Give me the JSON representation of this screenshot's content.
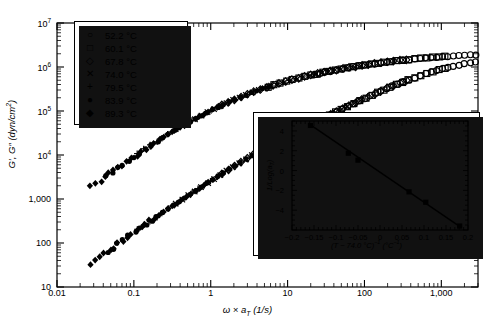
{
  "chart_data": {
    "type": "scatter",
    "title": "",
    "xlabel": "ω × a_T (1/s)",
    "ylabel": "G', G\" (dyn/cm²)",
    "xscale": "log",
    "yscale": "log",
    "xlim": [
      0.01,
      3000
    ],
    "ylim": [
      10,
      10000000
    ],
    "xticks": [
      "0.01",
      "0.1",
      "1",
      "10",
      "100",
      "1,000"
    ],
    "xtick_values": [
      0.01,
      0.1,
      1,
      10,
      100,
      1000
    ],
    "yticks": [
      "10",
      "100",
      "1,000",
      "10⁴",
      "10⁵",
      "10⁶",
      "10⁷"
    ],
    "ytick_values": [
      10,
      100,
      1000,
      10000,
      100000,
      1000000,
      10000000
    ],
    "grid": false,
    "legend_position": "upper-left",
    "legend": [
      {
        "marker": "open-circle",
        "label": "52.2 °C"
      },
      {
        "marker": "open-square",
        "label": "60.1 °C"
      },
      {
        "marker": "open-diamond",
        "label": "67.8 °C"
      },
      {
        "marker": "cross-x",
        "label": "74.0 °C"
      },
      {
        "marker": "plus",
        "label": "79.5 °C"
      },
      {
        "marker": "filled-circle",
        "label": "83.9 °C"
      },
      {
        "marker": "filled-diamond",
        "label": "89.3 °C"
      }
    ],
    "series": [
      {
        "name": "G'",
        "branch": "upper",
        "points": [
          [
            0.028,
            1900
          ],
          [
            0.035,
            2500
          ],
          [
            0.045,
            3400
          ],
          [
            0.058,
            4600
          ],
          [
            0.075,
            6300
          ],
          [
            0.1,
            9000
          ],
          [
            0.13,
            12500
          ],
          [
            0.17,
            17000
          ],
          [
            0.22,
            23000
          ],
          [
            0.3,
            32000
          ],
          [
            0.4,
            43000
          ],
          [
            0.55,
            58000
          ],
          [
            0.75,
            78000
          ],
          [
            1.0,
            103000
          ],
          [
            1.4,
            135000
          ],
          [
            1.9,
            172000
          ],
          [
            2.6,
            215000
          ],
          [
            3.5,
            265000
          ],
          [
            5.0,
            330000
          ],
          [
            7.0,
            400000
          ],
          [
            10,
            480000
          ],
          [
            14,
            560000
          ],
          [
            20,
            650000
          ],
          [
            30,
            760000
          ],
          [
            45,
            870000
          ],
          [
            65,
            980000
          ],
          [
            95,
            1090000
          ],
          [
            140,
            1200000
          ],
          [
            200,
            1300000
          ],
          [
            300,
            1420000
          ],
          [
            450,
            1530000
          ],
          [
            650,
            1620000
          ],
          [
            950,
            1700000
          ],
          [
            1400,
            1780000
          ],
          [
            2000,
            1850000
          ],
          [
            2800,
            1900000
          ]
        ]
      },
      {
        "name": "G\"",
        "branch": "lower",
        "points": [
          [
            0.028,
            33
          ],
          [
            0.035,
            45
          ],
          [
            0.045,
            62
          ],
          [
            0.058,
            85
          ],
          [
            0.075,
            120
          ],
          [
            0.1,
            170
          ],
          [
            0.13,
            240
          ],
          [
            0.17,
            330
          ],
          [
            0.22,
            460
          ],
          [
            0.3,
            650
          ],
          [
            0.4,
            900
          ],
          [
            0.55,
            1300
          ],
          [
            0.75,
            1850
          ],
          [
            1.0,
            2600
          ],
          [
            1.4,
            3700
          ],
          [
            1.9,
            5200
          ],
          [
            2.6,
            7300
          ],
          [
            3.5,
            10000
          ],
          [
            5.0,
            14500
          ],
          [
            7.0,
            20000
          ],
          [
            10,
            28000
          ],
          [
            14,
            38000
          ],
          [
            20,
            52000
          ],
          [
            30,
            73000
          ],
          [
            45,
            100000
          ],
          [
            65,
            135000
          ],
          [
            95,
            185000
          ],
          [
            140,
            250000
          ],
          [
            200,
            330000
          ],
          [
            300,
            440000
          ],
          [
            450,
            570000
          ],
          [
            650,
            720000
          ],
          [
            950,
            880000
          ],
          [
            1400,
            1040000
          ],
          [
            2000,
            1180000
          ],
          [
            2800,
            1280000
          ]
        ]
      }
    ]
  },
  "inset_chart": {
    "type": "scatter",
    "xlabel": "(T − 74.0 °C)⁻¹ (°C⁻¹)",
    "ylabel": "1/Log(a_T)",
    "xlim": [
      -0.2,
      0.2
    ],
    "ylim": [
      -6,
      5
    ],
    "xticks": [
      "-0.2",
      "-0.15",
      "-0.1",
      "-0.05",
      "0",
      "0.05",
      "0.1",
      "0.15",
      "0.2"
    ],
    "xtick_values": [
      -0.2,
      -0.15,
      -0.1,
      -0.05,
      0,
      0.05,
      0.1,
      0.15,
      0.2
    ],
    "yticks": [
      "4",
      "2",
      "0",
      "-2",
      "-4"
    ],
    "ytick_values": [
      4,
      2,
      0,
      -2,
      -4
    ],
    "grid": false,
    "points": [
      [
        -0.158,
        4.55
      ],
      [
        -0.072,
        1.75
      ],
      [
        -0.05,
        1.05
      ],
      [
        0.066,
        -2.15
      ],
      [
        0.104,
        -3.2
      ],
      [
        0.181,
        -5.6
      ]
    ],
    "fit_line": {
      "x0": -0.163,
      "y0": 4.75,
      "x1": 0.185,
      "y1": -5.75
    }
  },
  "colors": {
    "axis": "#000000",
    "marker": "#000000",
    "background": "#ffffff"
  }
}
